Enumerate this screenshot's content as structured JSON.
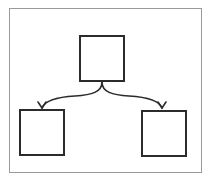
{
  "diagram": {
    "type": "tree",
    "nodes": [
      {
        "id": "parent",
        "label": ""
      },
      {
        "id": "child-left",
        "label": ""
      },
      {
        "id": "child-right",
        "label": ""
      }
    ],
    "edges": [
      {
        "from": "parent",
        "to": "child-left"
      },
      {
        "from": "parent",
        "to": "child-right"
      }
    ],
    "colors": {
      "stroke": "#2b2b2b",
      "frame": "#9a9a9a",
      "background": "#ffffff"
    }
  }
}
